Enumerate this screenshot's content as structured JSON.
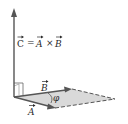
{
  "diagram": {
    "equation": {
      "lhs": "C",
      "equals": "=",
      "a": "A",
      "times": "×",
      "b": "B"
    },
    "labels": {
      "vector_a": "A",
      "vector_b": "B",
      "angle": "φ"
    },
    "colors": {
      "line": "#555555",
      "parallelogram_fill": "#d9d9d9",
      "text": "#2a2a2a"
    }
  }
}
